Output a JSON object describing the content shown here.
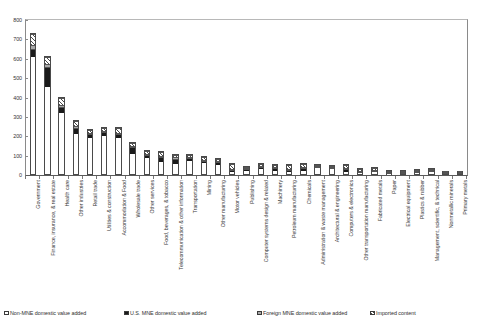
{
  "chart_data": {
    "type": "bar",
    "subtype": "stacked-vertical",
    "title": "",
    "xlabel": "",
    "ylabel": "",
    "ylim": [
      0,
      800
    ],
    "ytick_values": [
      0,
      100,
      200,
      300,
      400,
      500,
      600,
      700,
      800
    ],
    "ytick_labels": [
      "0",
      "100",
      "200",
      "300",
      "400",
      "500",
      "600",
      "700",
      "800"
    ],
    "grid": false,
    "legend_position": "bottom",
    "categories": [
      "Government",
      "Finance, insurance, & real estate",
      "Health care",
      "Other industries",
      "Retail trade",
      "Utilities & construction",
      "Accommodation & Food",
      "Wholesale trade",
      "Other services",
      "Food, beverages, & tobacco",
      "Telecommunication & other information",
      "Transportation",
      "Mining",
      "Other manufacturing",
      "Motor vehicles",
      "Publishing",
      "Computer systems design & related",
      "Machinery",
      "Petroleum manufacturing",
      "Chemicals",
      "Administration & waste management",
      "Architectural & engineering",
      "Computers & electronics",
      "Other transportation manufacturing",
      "Fabricated metals",
      "Paper",
      "Electrical equipment",
      "Plastics & rubber",
      "Management, scientific, & technical",
      "Nonmetallic minerals",
      "Primary metals"
    ],
    "series": [
      {
        "name": "Non-MNE domestic value added",
        "swatch": "sw-nonmne",
        "values": [
          613,
          455,
          322,
          215,
          196,
          205,
          196,
          112,
          90,
          70,
          55,
          74,
          65,
          57,
          10,
          22,
          37,
          24,
          13,
          20,
          40,
          40,
          15,
          9,
          23,
          10,
          8,
          17,
          26,
          14,
          8
        ]
      },
      {
        "name": "U.S. MNE domestic value added",
        "swatch": "sw-usmne",
        "values": [
          42,
          105,
          35,
          34,
          20,
          20,
          18,
          35,
          18,
          25,
          34,
          18,
          14,
          14,
          16,
          12,
          12,
          14,
          16,
          18,
          8,
          6,
          16,
          10,
          6,
          7,
          6,
          5,
          4,
          3,
          4
        ]
      },
      {
        "name": "Foreign MNE domestic value added",
        "swatch": "sw-foreign",
        "values": [
          20,
          16,
          10,
          9,
          5,
          5,
          5,
          8,
          5,
          8,
          7,
          5,
          5,
          4,
          7,
          4,
          4,
          5,
          5,
          6,
          3,
          2,
          6,
          4,
          3,
          3,
          3,
          3,
          2,
          2,
          2
        ]
      },
      {
        "name": "Imported content",
        "swatch": "sw-imported",
        "values": [
          60,
          40,
          35,
          25,
          18,
          18,
          28,
          17,
          14,
          22,
          14,
          13,
          12,
          14,
          30,
          11,
          9,
          14,
          25,
          17,
          6,
          5,
          18,
          12,
          8,
          7,
          8,
          8,
          4,
          4,
          6
        ]
      }
    ]
  },
  "legend": {
    "items": [
      {
        "label": "Non-MNE domestic value added",
        "swatch": "sw-nonmne"
      },
      {
        "label": "U.S. MNE domestic value added",
        "swatch": "sw-usmne"
      },
      {
        "label": "Foreign MNE domestic value added",
        "swatch": "sw-foreign"
      },
      {
        "label": "Imported content",
        "swatch": "sw-imported"
      }
    ]
  },
  "colors": {
    "non_mne": "#ffffff",
    "us_mne": "#1a1a1a",
    "foreign_mne": "#a8a8a8",
    "imported": "#4a4a4a",
    "axis": "#5a5a5a",
    "text": "#333333"
  }
}
